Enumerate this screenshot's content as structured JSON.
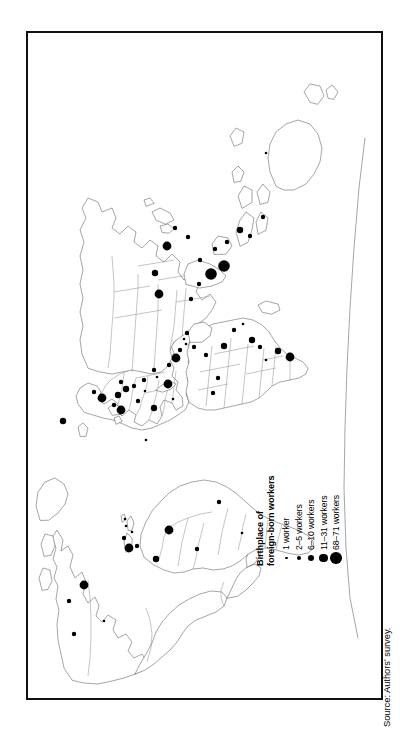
{
  "figure": {
    "kind": "thematic-world-map",
    "orientation": "rotated-90-ccw",
    "frame_border_color": "#111111",
    "coastline_color": "#5a5a5a",
    "country_border_color": "#7d7d7d",
    "symbol_color": "#000000",
    "background_color": "#ffffff"
  },
  "legend": {
    "title_line1": "Birthplace of",
    "title_line2": "foreign-born workers",
    "classes": [
      {
        "label": "1 worker",
        "radius_px": 1.3,
        "min": 1,
        "max": 1
      },
      {
        "label": "2–5 workers",
        "radius_px": 2.2,
        "min": 2,
        "max": 5
      },
      {
        "label": "6–10 workers",
        "radius_px": 3.2,
        "min": 6,
        "max": 10
      },
      {
        "label": "11–31 workers",
        "radius_px": 4.4,
        "min": 11,
        "max": 31
      },
      {
        "label": "68–71 workers",
        "radius_px": 5.8,
        "min": 68,
        "max": 71
      }
    ]
  },
  "source": {
    "text": "Source: Authors' survey."
  },
  "chart_data": {
    "type": "map",
    "title": "Birthplace of foreign-born workers",
    "projection_note": "Equirectangular world map, drawn landscape and rotated 90° counter-clockwise on the page",
    "symbol_encoding": "proportional circle area by worker count",
    "legend_entries": [
      "1 worker",
      "2–5 workers",
      "6–10 workers",
      "11–31 workers",
      "68–71 workers"
    ],
    "points": [
      {
        "x": 64,
        "y": 46,
        "class": 1,
        "label": "Canada / Alberta"
      },
      {
        "x": 77,
        "y": 76,
        "class": 0,
        "label": "Canada / Ontario"
      },
      {
        "x": 97,
        "y": 41,
        "class": 1,
        "label": "Canada / Quebec"
      },
      {
        "x": 113,
        "y": 56,
        "class": 3,
        "label": "USA / Northeast"
      },
      {
        "x": 150,
        "y": 101,
        "class": 3,
        "label": "Caribbean / Haiti"
      },
      {
        "x": 152,
        "y": 109,
        "class": 1,
        "label": "Caribbean / Dominican Rep."
      },
      {
        "x": 160,
        "y": 96,
        "class": 1,
        "label": "Caribbean / Jamaica"
      },
      {
        "x": 166,
        "y": 104,
        "class": 0,
        "label": "Caribbean / Trinidad"
      },
      {
        "x": 172,
        "y": 98,
        "class": 0,
        "label": "Caribbean / Barbados"
      },
      {
        "x": 179,
        "y": 97,
        "class": 0,
        "label": "Caribbean / St. Lucia"
      },
      {
        "x": 139,
        "y": 128,
        "class": 2,
        "label": "Colombia"
      },
      {
        "x": 168,
        "y": 141,
        "class": 3,
        "label": "Brazil / North"
      },
      {
        "x": 149,
        "y": 169,
        "class": 1,
        "label": "Peru"
      },
      {
        "x": 196,
        "y": 191,
        "class": 1,
        "label": "Brazil / Southeast"
      },
      {
        "x": 165,
        "y": 214,
        "class": 0,
        "label": "Chile"
      },
      {
        "x": 277,
        "y": 35,
        "class": 2,
        "label": "Iceland / North Atlantic"
      },
      {
        "x": 306,
        "y": 66,
        "class": 1,
        "label": "Sweden"
      },
      {
        "x": 300,
        "y": 74,
        "class": 3,
        "label": "Denmark"
      },
      {
        "x": 293,
        "y": 86,
        "class": 1,
        "label": "Netherlands"
      },
      {
        "x": 288,
        "y": 93,
        "class": 3,
        "label": "United Kingdom"
      },
      {
        "x": 303,
        "y": 90,
        "class": 2,
        "label": "Germany"
      },
      {
        "x": 309,
        "y": 98,
        "class": 2,
        "label": "Poland"
      },
      {
        "x": 316,
        "y": 93,
        "class": 1,
        "label": "Belarus"
      },
      {
        "x": 312,
        "y": 106,
        "class": 1,
        "label": "Czechia"
      },
      {
        "x": 297,
        "y": 110,
        "class": 1,
        "label": "France"
      },
      {
        "x": 307,
        "y": 117,
        "class": 0,
        "label": "Switzerland"
      },
      {
        "x": 318,
        "y": 116,
        "class": 1,
        "label": "Hungary"
      },
      {
        "x": 290,
        "y": 126,
        "class": 2,
        "label": "Spain"
      },
      {
        "x": 321,
        "y": 129,
        "class": 0,
        "label": "Serbia"
      },
      {
        "x": 328,
        "y": 126,
        "class": 1,
        "label": "Romania"
      },
      {
        "x": 314,
        "y": 140,
        "class": 3,
        "label": "Italy"
      },
      {
        "x": 299,
        "y": 145,
        "class": 0,
        "label": "Portugal"
      },
      {
        "x": 333,
        "y": 141,
        "class": 1,
        "label": "Greece"
      },
      {
        "x": 340,
        "y": 148,
        "class": 3,
        "label": "Turkey"
      },
      {
        "x": 348,
        "y": 152,
        "class": 1,
        "label": "Cyprus"
      },
      {
        "x": 354,
        "y": 158,
        "class": 0,
        "label": "Lebanon"
      },
      {
        "x": 359,
        "y": 156,
        "class": 0,
        "label": "Syria"
      },
      {
        "x": 365,
        "y": 159,
        "class": 1,
        "label": "Iraq"
      },
      {
        "x": 351,
        "y": 166,
        "class": 1,
        "label": "Israel"
      },
      {
        "x": 343,
        "y": 178,
        "class": 1,
        "label": "Egypt"
      },
      {
        "x": 320,
        "y": 190,
        "class": 1,
        "label": "Algeria"
      },
      {
        "x": 305,
        "y": 185,
        "class": 1,
        "label": "Morocco"
      },
      {
        "x": 352,
        "y": 196,
        "class": 2,
        "label": "Sudan"
      },
      {
        "x": 368,
        "y": 206,
        "class": 1,
        "label": "Ethiopia"
      },
      {
        "x": 374,
        "y": 215,
        "class": 0,
        "label": "Somalia"
      },
      {
        "x": 358,
        "y": 224,
        "class": 2,
        "label": "Kenya"
      },
      {
        "x": 351,
        "y": 232,
        "class": 1,
        "label": "Tanzania"
      },
      {
        "x": 338,
        "y": 238,
        "class": 0,
        "label": "Zambia"
      },
      {
        "x": 347,
        "y": 250,
        "class": 2,
        "label": "Zimbabwe"
      },
      {
        "x": 341,
        "y": 262,
        "class": 3,
        "label": "South Africa"
      },
      {
        "x": 399,
        "y": 163,
        "class": 1,
        "label": "Iran"
      },
      {
        "x": 414,
        "y": 171,
        "class": 1,
        "label": "Pakistan"
      },
      {
        "x": 424,
        "y": 183,
        "class": 4,
        "label": "India"
      },
      {
        "x": 432,
        "y": 196,
        "class": 4,
        "label": "Sri Lanka / South India"
      },
      {
        "x": 438,
        "y": 172,
        "class": 1,
        "label": "Nepal"
      },
      {
        "x": 449,
        "y": 187,
        "class": 1,
        "label": "Bangladesh"
      },
      {
        "x": 404,
        "y": 131,
        "class": 3,
        "label": "Kazakhstan"
      },
      {
        "x": 425,
        "y": 127,
        "class": 2,
        "label": "Russia / Siberia"
      },
      {
        "x": 452,
        "y": 139,
        "class": 3,
        "label": "China"
      },
      {
        "x": 470,
        "y": 147,
        "class": 1,
        "label": "Japan"
      },
      {
        "x": 461,
        "y": 160,
        "class": 1,
        "label": "Korea"
      },
      {
        "x": 456,
        "y": 199,
        "class": 1,
        "label": "Vietnam"
      },
      {
        "x": 468,
        "y": 212,
        "class": 2,
        "label": "Philippines"
      },
      {
        "x": 462,
        "y": 222,
        "class": 1,
        "label": "Malaysia"
      },
      {
        "x": 481,
        "y": 235,
        "class": 1,
        "label": "Indonesia"
      },
      {
        "x": 545,
        "y": 238,
        "class": 0,
        "label": "Australia"
      },
      {
        "x": 258,
        "y": 118,
        "class": 0,
        "label": "North Atlantic"
      }
    ]
  }
}
